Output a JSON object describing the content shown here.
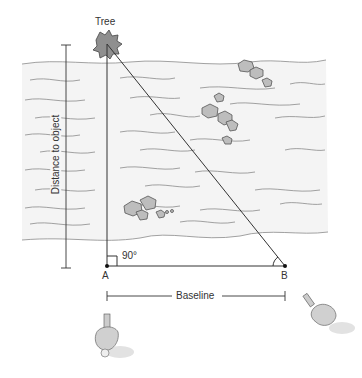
{
  "diagram": {
    "type": "triangulation-distance-measurement",
    "labels": {
      "object": "Tree",
      "distance": "Distance to object",
      "angle": "90°",
      "point_a": "A",
      "point_b": "B",
      "baseline": "Baseline"
    },
    "colors": {
      "river": "#f4f4f4",
      "wave": "#8a8a8a",
      "line": "#333333"
    }
  }
}
